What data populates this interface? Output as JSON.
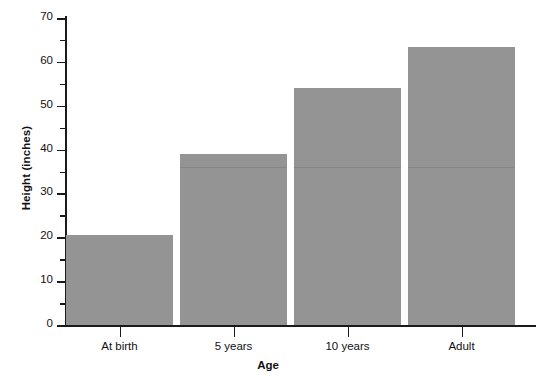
{
  "chart_data": {
    "type": "bar",
    "title": "",
    "categories": [
      "At birth",
      "5 years",
      "10 years",
      "Adult"
    ],
    "values": [
      20.5,
      39,
      54,
      63.5
    ],
    "xlabel": "Age",
    "ylabel": "Height (inches)",
    "ylim": [
      0,
      70
    ],
    "ytick_major": [
      0,
      10,
      20,
      30,
      40,
      50,
      60,
      70
    ],
    "ytick_minor": [
      5,
      15,
      25,
      35,
      45,
      55,
      65
    ],
    "ytick_labels": [
      "0",
      "10",
      "20",
      "30",
      "40",
      "50",
      "60",
      "70"
    ],
    "grid": false,
    "legend": false,
    "bar_color": "#949494",
    "axis_color": "#1a1a1a",
    "background": "#ffffff"
  }
}
